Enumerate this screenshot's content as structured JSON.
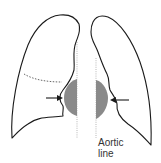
{
  "figure": {
    "labels": {
      "aortic_line_1": "Aortic",
      "aortic_line_2": "line"
    },
    "elements": {
      "right_lung": "right-lung-outline",
      "left_lung": "left-lung-outline",
      "fissure": "dotted horizontal fissure",
      "mass_right": "shaded mass right of midline",
      "mass_left": "shaded mass left of midline",
      "arrows": [
        "arrow pointing right at right hilum",
        "arrow pointing left at left hilum"
      ]
    },
    "colors": {
      "outline": "#1a1a1a",
      "mass": "#8a8a8a",
      "midline": "#9a9a9a"
    }
  }
}
